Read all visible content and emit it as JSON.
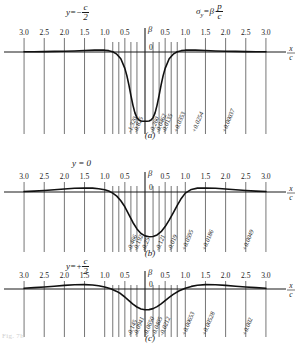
{
  "figure": {
    "title_left": "y = -c/2",
    "formula": "σy = β · p/c",
    "x_axis_label": "x/c",
    "beta_axis_label": "β",
    "footer_note": "Fig. 7b"
  },
  "chart_data": [
    {
      "type": "line",
      "panel": "(a)",
      "title": "y = -c/2",
      "condition_y": "-c/2",
      "xlabel": "x/c",
      "ylabel": "β",
      "ylim": [
        -1.45,
        0.12
      ],
      "xlim": [
        -3.25,
        3.25
      ],
      "grid": true,
      "tick_labels": [
        "3.0",
        "2.5",
        "2.0",
        "1.5",
        "1.0",
        "0.5",
        "0",
        "0.5",
        "1.0",
        "1.5",
        "2.0",
        "2.5",
        "3.0"
      ],
      "tick_x": [
        -3.0,
        -2.5,
        -2.0,
        -1.5,
        -1.0,
        -0.5,
        0,
        0.5,
        1.0,
        1.5,
        2.0,
        2.5,
        3.0
      ],
      "extra_gridlines_x": [
        -0.8,
        -0.65,
        -0.35,
        -0.2,
        0.2,
        0.35,
        0.65,
        0.8
      ],
      "value_labels": [
        {
          "x": -0.35,
          "text": "-1.320"
        },
        {
          "x": -0.2,
          "text": "-0.825"
        },
        {
          "x": 0.2,
          "text": "-0.260"
        },
        {
          "x": 0.35,
          "text": "-0.0462"
        },
        {
          "x": 0.5,
          "text": "-0.0135"
        },
        {
          "x": 0.8,
          "text": "+0.0353"
        },
        {
          "x": 1.25,
          "text": "+0.0254"
        },
        {
          "x": 2.0,
          "text": "+0.00037"
        }
      ],
      "x": [
        -3.0,
        -2.75,
        -2.5,
        -2.25,
        -2.0,
        -1.75,
        -1.5,
        -1.25,
        -1.1,
        -1.0,
        -0.9,
        -0.8,
        -0.7,
        -0.6,
        -0.5,
        -0.45,
        -0.4,
        -0.35,
        -0.3,
        -0.25,
        -0.2,
        -0.15,
        -0.1,
        -0.05,
        0,
        0.05,
        0.1,
        0.15,
        0.2,
        0.25,
        0.3,
        0.35,
        0.4,
        0.45,
        0.5,
        0.6,
        0.7,
        0.8,
        0.9,
        1.0,
        1.1,
        1.25,
        1.5,
        1.75,
        2.0,
        2.25,
        2.5,
        2.75,
        3.0
      ],
      "y": [
        0.004,
        0.006,
        0.008,
        0.012,
        0.016,
        0.022,
        0.03,
        0.038,
        0.04,
        0.038,
        0.028,
        0.005,
        -0.045,
        -0.14,
        -0.34,
        -0.49,
        -0.68,
        -0.9,
        -1.1,
        -1.26,
        -1.36,
        -1.41,
        -1.43,
        -1.435,
        -1.435,
        -1.435,
        -1.43,
        -1.41,
        -1.36,
        -1.26,
        -1.1,
        -0.9,
        -0.68,
        -0.49,
        -0.34,
        -0.14,
        -0.045,
        0.005,
        0.028,
        0.038,
        0.04,
        0.038,
        0.03,
        0.022,
        0.016,
        0.012,
        0.008,
        0.006,
        0.004
      ]
    },
    {
      "type": "line",
      "panel": "(b)",
      "title": "y = 0",
      "condition_y": "0",
      "xlabel": "x/c",
      "ylabel": "β",
      "ylim": [
        -0.52,
        0.07
      ],
      "xlim": [
        -3.25,
        3.25
      ],
      "grid": true,
      "tick_labels": [
        "3.0",
        "2.5",
        "2.0",
        "1.5",
        "1.0",
        "0.5",
        "0",
        "0.5",
        "1.0",
        "1.5",
        "2.0",
        "2.5",
        "3.0"
      ],
      "tick_x": [
        -3.0,
        -2.5,
        -2.0,
        -1.5,
        -1.0,
        -0.5,
        0,
        0.5,
        1.0,
        1.5,
        2.0,
        2.5,
        3.0
      ],
      "extra_gridlines_x": [
        -0.8,
        -0.65,
        -0.35,
        -0.2,
        0.2,
        0.35,
        0.65,
        0.8
      ],
      "value_labels": [
        {
          "x": -0.35,
          "text": "-0.466"
        },
        {
          "x": -0.2,
          "text": "-0.192"
        },
        {
          "x": 0.0,
          "text": "-0.25"
        },
        {
          "x": 0.35,
          "text": "-0.121"
        },
        {
          "x": 0.65,
          "text": "-0.019"
        },
        {
          "x": 1.0,
          "text": "+0.0595"
        },
        {
          "x": 1.5,
          "text": "+0.0186"
        },
        {
          "x": 2.5,
          "text": "+0.0049"
        }
      ],
      "x": [
        -3.0,
        -2.75,
        -2.5,
        -2.25,
        -2.0,
        -1.75,
        -1.5,
        -1.3,
        -1.15,
        -1.0,
        -0.9,
        -0.8,
        -0.7,
        -0.6,
        -0.5,
        -0.4,
        -0.3,
        -0.2,
        -0.1,
        0,
        0.1,
        0.2,
        0.3,
        0.4,
        0.5,
        0.6,
        0.7,
        0.8,
        0.9,
        1.0,
        1.15,
        1.3,
        1.5,
        1.75,
        2.0,
        2.25,
        2.5,
        2.75,
        3.0
      ],
      "y": [
        0.005,
        0.01,
        0.016,
        0.024,
        0.032,
        0.04,
        0.044,
        0.042,
        0.036,
        0.024,
        0.01,
        -0.012,
        -0.045,
        -0.095,
        -0.16,
        -0.245,
        -0.33,
        -0.4,
        -0.45,
        -0.475,
        -0.485,
        -0.482,
        -0.465,
        -0.43,
        -0.375,
        -0.305,
        -0.225,
        -0.145,
        -0.07,
        -0.012,
        0.028,
        0.042,
        0.044,
        0.04,
        0.032,
        0.024,
        0.016,
        0.01,
        0.005
      ]
    },
    {
      "type": "line",
      "panel": "(c)",
      "title": "y = +c/2",
      "condition_y": "+c/2",
      "xlabel": "x/c",
      "ylabel": "β",
      "ylim": [
        -0.18,
        0.05
      ],
      "xlim": [
        -3.25,
        3.25
      ],
      "grid": true,
      "tick_labels": [
        "3.0",
        "2.5",
        "2.0",
        "1.5",
        "1.0",
        "0.5",
        "0",
        "0.5",
        "1.0",
        "1.5",
        "2.0",
        "2.5",
        "3.0"
      ],
      "tick_x": [
        -3.0,
        -2.5,
        -2.0,
        -1.5,
        -1.0,
        -0.5,
        0,
        0.5,
        1.0,
        1.5,
        2.0,
        2.5,
        3.0
      ],
      "extra_gridlines_x": [
        -0.8,
        -0.65,
        -0.35,
        -0.2,
        0.2,
        0.35,
        0.65,
        0.8
      ],
      "value_labels": [
        {
          "x": -0.35,
          "text": "-0.145"
        },
        {
          "x": -0.2,
          "text": "-0.0941"
        },
        {
          "x": 0.05,
          "text": "-0.0650"
        },
        {
          "x": 0.25,
          "text": "-0.0405"
        },
        {
          "x": 0.45,
          "text": "-0.0212"
        },
        {
          "x": 1.0,
          "text": "+0.00653"
        },
        {
          "x": 1.5,
          "text": "+0.00528"
        },
        {
          "x": 2.5,
          "text": "+0.002"
        }
      ],
      "x": [
        -3.0,
        -2.75,
        -2.5,
        -2.25,
        -2.0,
        -1.75,
        -1.5,
        -1.3,
        -1.15,
        -1.0,
        -0.85,
        -0.7,
        -0.6,
        -0.5,
        -0.4,
        -0.3,
        -0.2,
        -0.1,
        0,
        0.1,
        0.2,
        0.3,
        0.4,
        0.5,
        0.6,
        0.7,
        0.85,
        1.0,
        1.15,
        1.3,
        1.5,
        1.75,
        2.0,
        2.25,
        2.5,
        2.75,
        3.0
      ],
      "y": [
        0.004,
        0.007,
        0.01,
        0.014,
        0.018,
        0.021,
        0.022,
        0.02,
        0.016,
        0.01,
        0.001,
        -0.012,
        -0.024,
        -0.04,
        -0.058,
        -0.076,
        -0.09,
        -0.1,
        -0.104,
        -0.103,
        -0.098,
        -0.088,
        -0.074,
        -0.058,
        -0.042,
        -0.027,
        -0.009,
        0.004,
        0.013,
        0.019,
        0.022,
        0.021,
        0.018,
        0.014,
        0.01,
        0.007,
        0.004
      ]
    }
  ]
}
